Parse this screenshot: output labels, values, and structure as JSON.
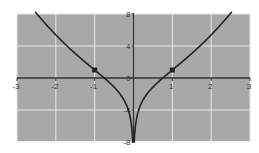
{
  "chart_data": {
    "type": "line",
    "title": "",
    "xlabel": "",
    "ylabel": "",
    "xlim": [
      -3,
      3
    ],
    "ylim": [
      -8,
      8
    ],
    "grid": true,
    "x_ticks": [
      -3,
      -2,
      -1,
      0,
      1,
      2,
      3
    ],
    "y_ticks": [
      8,
      4,
      0,
      -4,
      -8
    ],
    "x_tick_labels": [
      "-3",
      "-2",
      "-1",
      "0",
      "1",
      "2",
      "3"
    ],
    "y_tick_labels": [
      "8",
      "4",
      "0",
      "-4",
      "-8"
    ],
    "series": [
      {
        "name": "curve",
        "function": "y = x^2 + 2 ln|x|",
        "x": [
          -2.5,
          -2,
          -1.5,
          -1,
          -0.75,
          -0.5,
          -0.25,
          -0.1,
          0.1,
          0.25,
          0.5,
          0.75,
          1,
          1.5,
          2,
          2.5
        ],
        "y": [
          8.08,
          5.39,
          3.06,
          1.0,
          -0.01,
          -1.14,
          -2.71,
          -4.6,
          -4.6,
          -2.71,
          -1.14,
          -0.01,
          1.0,
          3.06,
          5.39,
          8.08
        ]
      }
    ],
    "points": [
      {
        "x": -1,
        "y": 1
      },
      {
        "x": 1,
        "y": 1
      }
    ],
    "colors": {
      "background": "#a8a8a8",
      "grid": "#e8e8e8",
      "axis": "#333333",
      "curve": "#222222"
    }
  }
}
